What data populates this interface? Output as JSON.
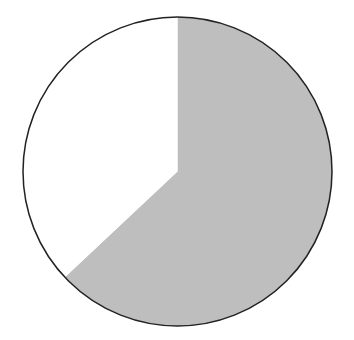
{
  "chart_data": {
    "type": "pie",
    "title": "",
    "labels": [
      "Slice A",
      "Slice B"
    ],
    "values": [
      63,
      37
    ],
    "colors": [
      "#bebebe",
      "#ffffff"
    ],
    "start_angle_deg": 0,
    "direction": "clockwise",
    "outline_color": "#222222",
    "legend": "none",
    "geometry": {
      "cx": 177.5,
      "cy": 171.5,
      "r": 154.5
    }
  }
}
